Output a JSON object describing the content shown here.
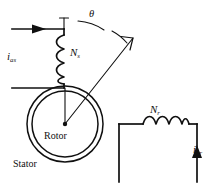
{
  "figure": {
    "type": "electrical-machine-schematic",
    "background_color": "#ffffff",
    "line_color": "#101010",
    "width": 215,
    "height": 187
  },
  "labels": {
    "stator_current": {
      "symbol": "i",
      "subscript": "as"
    },
    "stator_turns": {
      "symbol": "N",
      "subscript": "s"
    },
    "angle": "θ",
    "rotor_text": "Rotor",
    "stator_text": "Stator",
    "rotor_turns": {
      "symbol": "N",
      "subscript": "r"
    },
    "rotor_current": {
      "symbol": "i",
      "subscript": "br"
    }
  },
  "geometry": {
    "rotor_center": {
      "x": 65,
      "y": 124
    },
    "outer_circle_radius": 38,
    "inner_circle_radius": 33,
    "reference_line_angle_deg": 90,
    "axis_line_angle_deg": 62
  }
}
